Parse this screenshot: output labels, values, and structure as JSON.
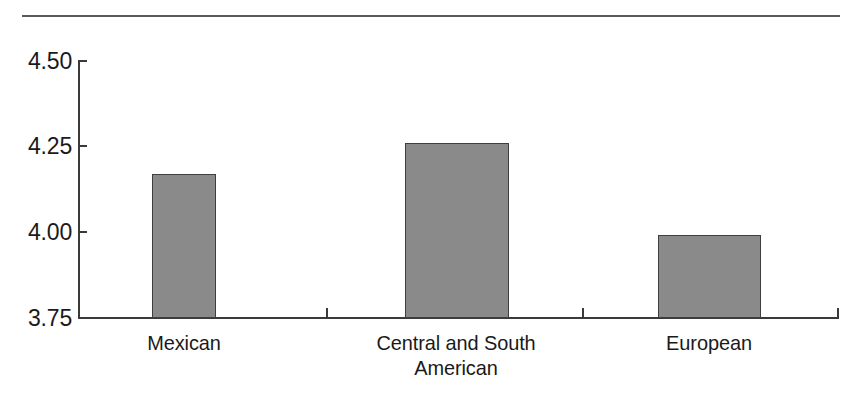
{
  "chart_data": {
    "type": "bar",
    "title": "",
    "subtitle": "",
    "xlabel": "",
    "ylabel": "",
    "categories": [
      "Mexican",
      "Central and South American",
      "European"
    ],
    "category_lines": [
      [
        "Mexican"
      ],
      [
        "Central and South",
        "American"
      ],
      [
        "European"
      ]
    ],
    "values": [
      4.17,
      4.26,
      3.99
    ],
    "series": [
      {
        "name": "",
        "values": [
          4.17,
          4.26,
          3.99
        ]
      }
    ],
    "ylim": [
      3.75,
      4.5
    ],
    "yticks": [
      "4.50",
      "4.25",
      "4.00",
      "3.75"
    ],
    "ytick_values": [
      4.5,
      4.25,
      4.0,
      3.75
    ],
    "grid": false,
    "legend": false,
    "legend_position": "none",
    "bar_color": "#8a8a8a",
    "bar_edge_color": "#3f3f3f",
    "axis_color": "#3a3a3a",
    "rule_color": "#5a5a5a",
    "background": "#ffffff",
    "annotations": []
  }
}
